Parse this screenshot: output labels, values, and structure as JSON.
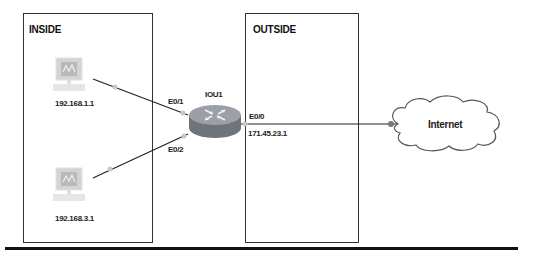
{
  "zones": {
    "inside": {
      "label": "INSIDE"
    },
    "outside": {
      "label": "OUTSIDE"
    }
  },
  "hosts": [
    {
      "name": "pc1",
      "ip": "192.168.1.1",
      "interface": "E0/1"
    },
    {
      "name": "pc2",
      "ip": "192.168.3.1",
      "interface": "E0/2"
    }
  ],
  "router": {
    "name": "IOU1",
    "outside_interface": "E0/0",
    "outside_ip": "171.45.23.1"
  },
  "cloud": {
    "label": "Internet"
  },
  "colors": {
    "border": "#333333",
    "router_body": "#7a7f85",
    "router_top": "#9aa0a6",
    "link": "#222222",
    "endpoint": "#c8c8c8",
    "pc": "#c9c9c9"
  }
}
